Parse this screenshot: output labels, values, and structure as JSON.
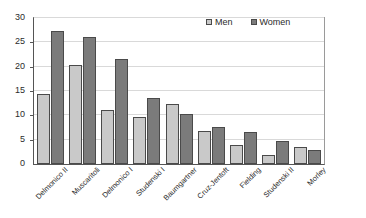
{
  "chart_data": {
    "type": "bar",
    "title": "",
    "subtitle": "",
    "xlabel": "",
    "ylabel": "",
    "ylim": [
      0,
      30
    ],
    "yticks": [
      0,
      5,
      10,
      15,
      20,
      25,
      30
    ],
    "ytick_labels": [
      "0",
      "5",
      "10",
      "15",
      "20",
      "25",
      "30"
    ],
    "grid": true,
    "grid_axis": "y",
    "legend_position": "top-right",
    "categories": [
      "Delmonico II",
      "Muscaritoli",
      "Delmonico I",
      "Studenski I",
      "Baumgartner",
      "Cruz-Jentoft",
      "Fielding",
      "Studenski II",
      "Morley"
    ],
    "series": [
      {
        "name": "Men",
        "color": "#c9c9c9",
        "values": [
          14.3,
          20.4,
          11.2,
          9.7,
          12.4,
          6.8,
          3.9,
          1.9,
          3.5
        ]
      },
      {
        "name": "Women",
        "color": "#7b7b7b",
        "values": [
          27.3,
          26.2,
          21.5,
          13.5,
          10.3,
          7.7,
          6.5,
          4.8,
          2.9
        ]
      }
    ]
  },
  "legend": {
    "entries": [
      {
        "label": "Men"
      },
      {
        "label": "Women"
      }
    ]
  },
  "colors": {
    "men": "#c9c9c9",
    "women": "#7b7b7b",
    "bar_border": "#4a4a4a",
    "axis": "#555555",
    "gridline": "#d9d9d9",
    "text": "#2b2b2b",
    "background": "#ffffff"
  }
}
